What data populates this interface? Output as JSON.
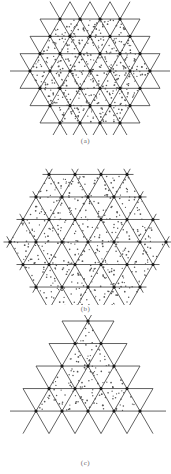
{
  "figure": {
    "background": "#ffffff",
    "line_color": "#3a3a3a",
    "node_color": "#1a1a1a",
    "dot_color": "#555555",
    "panels": [
      {
        "id": "a",
        "caption": "(a)",
        "caption_y": 137,
        "top": 0,
        "height": 135,
        "shape": "hexagon-extended",
        "cx": 90,
        "cy": 71,
        "spacing": 20,
        "rows": 7,
        "description": "Triangular lattice with extended lines; dotted sub-structure in hexagonal region"
      },
      {
        "id": "b",
        "caption": "(b)",
        "caption_y": 305,
        "top": 150,
        "height": 152,
        "shape": "hexagon",
        "cx": 88,
        "cy": 92,
        "spacing": 26,
        "rows": 7,
        "description": "Hexagonal patch of triangular lattice with dense dotted sub-structure"
      },
      {
        "id": "c",
        "caption": "(c)",
        "caption_y": 459,
        "top": 315,
        "height": 140,
        "shape": "triangle",
        "cx": 88,
        "cy": 0,
        "spacing": 26,
        "rows": 5,
        "description": "Triangular patch of triangular lattice with extended lines and dotted sub-structure"
      }
    ]
  }
}
